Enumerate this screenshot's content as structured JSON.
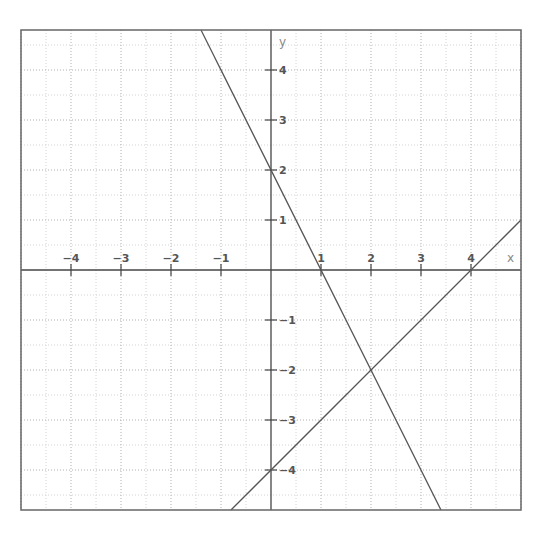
{
  "chart_data": {
    "type": "line",
    "title": "",
    "xlabel": "x",
    "ylabel": "y",
    "xlim": [
      -5,
      5
    ],
    "ylim": [
      -4.8,
      4.8
    ],
    "grid": {
      "on": true,
      "major_step": 1,
      "minor_step": 0.5,
      "style": "dotted"
    },
    "x_ticks": [
      -4,
      -3,
      -2,
      -1,
      1,
      2,
      3,
      4
    ],
    "x_tick_labels": [
      "−4",
      "−3",
      "−2",
      "−1",
      "1",
      "2",
      "3",
      "4"
    ],
    "y_ticks": [
      4,
      3,
      2,
      1,
      -1,
      -2,
      -3,
      -4
    ],
    "y_tick_labels": [
      "4",
      "3",
      "2",
      "−1",
      "−1",
      "−2",
      "−3",
      "−4"
    ],
    "series": [
      {
        "name": "line-1",
        "equation": "y = -2x + 2",
        "slope": -2,
        "intercept": 2,
        "points": [
          [
            -1.4,
            4.8
          ],
          [
            0,
            2
          ],
          [
            1,
            0
          ],
          [
            2,
            -2
          ],
          [
            3.4,
            -4.8
          ]
        ]
      },
      {
        "name": "line-2",
        "equation": "y = x - 4",
        "slope": 1,
        "intercept": -4,
        "points": [
          [
            -0.8,
            -4.8
          ],
          [
            0,
            -4
          ],
          [
            2,
            -2
          ],
          [
            4,
            0
          ],
          [
            5,
            1
          ]
        ]
      }
    ],
    "annotations": [
      {
        "type": "intersection",
        "x": 2,
        "y": -2
      }
    ]
  },
  "colors": {
    "background": "#ffffff",
    "frame": "#666666",
    "axis": "#444444",
    "grid_major": "#b0b0b0",
    "grid_minor": "#d4d4d4",
    "line": "#555555",
    "tick_label": "#555555",
    "axis_name": "#888888"
  },
  "labels": {
    "x_axis_name": "x",
    "y_axis_name": "y"
  }
}
